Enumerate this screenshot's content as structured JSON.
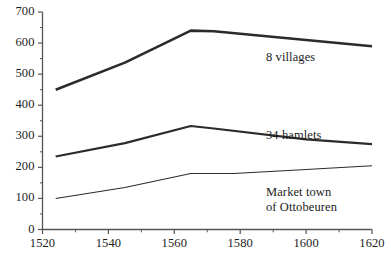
{
  "chart_data": {
    "type": "line",
    "title": "",
    "subtitle": "",
    "xlabel": "",
    "ylabel": "",
    "xlim": [
      1520,
      1620
    ],
    "ylim": [
      0,
      700
    ],
    "x_ticks": [
      1520,
      1540,
      1560,
      1580,
      1600,
      1620
    ],
    "x_tick_labels": [
      "1520",
      "1540",
      "1560",
      "1580",
      "1600",
      "1620"
    ],
    "x_minor_step": 10,
    "y_ticks": [
      0,
      100,
      200,
      300,
      400,
      500,
      600,
      700
    ],
    "y_tick_labels": [
      "0",
      "100",
      "200",
      "300",
      "400",
      "500",
      "600",
      "700"
    ],
    "y_minor_step": 50,
    "grid": false,
    "legend_position": "inline-annotations",
    "series": [
      {
        "name": "8 villages",
        "label": "8 villages",
        "label_lines": [
          "8 villages"
        ],
        "color": "#2b2b2b",
        "line_width": 2.6,
        "x": [
          1524,
          1545,
          1565,
          1572,
          1600,
          1620
        ],
        "values": [
          450,
          537,
          640,
          638,
          610,
          590
        ]
      },
      {
        "name": "34 hamlets",
        "label": "34 hamlets",
        "label_lines": [
          "34 hamlets"
        ],
        "color": "#2b2b2b",
        "line_width": 2.2,
        "x": [
          1524,
          1545,
          1565,
          1572,
          1600,
          1620
        ],
        "values": [
          235,
          278,
          333,
          325,
          290,
          275
        ]
      },
      {
        "name": "Market town of Ottobeuren",
        "label": "Market town of Ottobeuren",
        "label_lines": [
          "Market town",
          "of Ottobeuren"
        ],
        "color": "#2b2b2b",
        "line_width": 1.1,
        "x": [
          1524,
          1545,
          1565,
          1578,
          1600,
          1620
        ],
        "values": [
          100,
          135,
          180,
          180,
          193,
          205
        ]
      }
    ],
    "annotations": [
      {
        "text": "8 villages",
        "x_px": 266,
        "y_px": 50
      },
      {
        "text": "34 hamlets",
        "x_px": 266,
        "y_px": 128
      },
      {
        "text": "Market town",
        "x_px": 266,
        "y_px": 185
      },
      {
        "text": "of Ottobeuren",
        "x_px": 266,
        "y_px": 200
      }
    ],
    "axis_color": "#555555"
  }
}
